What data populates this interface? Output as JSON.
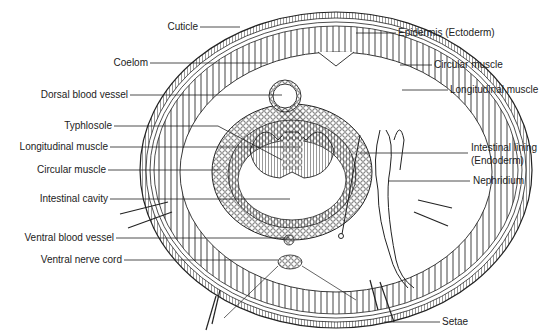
{
  "diagram": {
    "labels_left": [
      {
        "id": "cuticle",
        "text": "Cuticle"
      },
      {
        "id": "coelom",
        "text": "Coelom"
      },
      {
        "id": "dorsal_blood_vessel",
        "text": "Dorsal blood vessel"
      },
      {
        "id": "typhlosole",
        "text": "Typhlosole"
      },
      {
        "id": "longitudinal_muscle_inner",
        "text": "Longitudinal muscle"
      },
      {
        "id": "circular_muscle_inner",
        "text": "Circular muscle"
      },
      {
        "id": "intestinal_cavity",
        "text": "Intestinal cavity"
      },
      {
        "id": "ventral_blood_vessel",
        "text": "Ventral blood vessel"
      },
      {
        "id": "ventral_nerve_cord",
        "text": "Ventral nerve cord"
      }
    ],
    "labels_right": [
      {
        "id": "epidermis",
        "text": "Epidermis (Ectoderm)"
      },
      {
        "id": "circular_muscle_outer",
        "text": "Circular muscle"
      },
      {
        "id": "longitudinal_muscle_outer",
        "text": "Longitudinal muscle"
      },
      {
        "id": "intestinal_lining_1",
        "text": "Intestinal lining"
      },
      {
        "id": "intestinal_lining_2",
        "text": "(Endoderm)"
      },
      {
        "id": "nephridium",
        "text": "Nephridium"
      },
      {
        "id": "setae",
        "text": "Setae"
      }
    ],
    "colors": {
      "line": "#222222",
      "background": "#ffffff"
    }
  }
}
